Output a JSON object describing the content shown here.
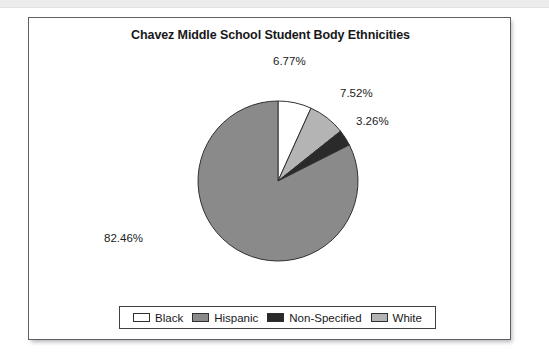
{
  "page": {
    "background": "#ffffff",
    "top_band_color": "#ececed"
  },
  "figure": {
    "frame_border_color": "#5d6064",
    "background": "#ffffff"
  },
  "chart_data": {
    "type": "pie",
    "title": "Chavez Middle School Student Body Ethnicities",
    "xlabel": "",
    "ylabel": "",
    "grid": false,
    "legend_position": "bottom",
    "units": "percent",
    "start_angle_deg": 0,
    "direction": "clockwise",
    "categories": [
      "Black",
      "White",
      "Non-Specified",
      "Hispanic"
    ],
    "values": [
      6.77,
      7.52,
      3.26,
      82.46
    ],
    "labels": [
      "6.77%",
      "7.52%",
      "3.26%",
      "82.46%"
    ],
    "colors": [
      "#ffffff",
      "#b4b4b4",
      "#2a2a2a",
      "#8a8a8a"
    ],
    "slices": [
      {
        "name": "Black",
        "value": 6.77,
        "label": "6.77%",
        "color": "#ffffff"
      },
      {
        "name": "White",
        "value": 7.52,
        "label": "7.52%",
        "color": "#b4b4b4"
      },
      {
        "name": "Non-Specified",
        "value": 3.26,
        "label": "3.26%",
        "color": "#2a2a2a"
      },
      {
        "name": "Hispanic",
        "value": 82.46,
        "label": "82.46%",
        "color": "#8a8a8a"
      }
    ],
    "legend": [
      {
        "label": "Black",
        "color": "#ffffff"
      },
      {
        "label": "Hispanic",
        "color": "#8a8a8a"
      },
      {
        "label": "Non-Specified",
        "color": "#2a2a2a"
      },
      {
        "label": "White",
        "color": "#b4b4b4"
      }
    ]
  }
}
